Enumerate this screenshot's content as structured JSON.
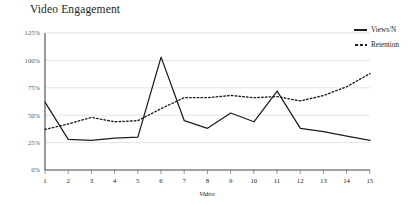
{
  "title": "Video Engagement",
  "legend": {
    "position": "top-right",
    "entries": [
      {
        "label": "Views/N",
        "style": "solid",
        "icon": "solid-line-icon"
      },
      {
        "label": "Retention",
        "style": "dotted",
        "icon": "dotted-line-icon"
      }
    ]
  },
  "axes": {
    "x_title": "Video",
    "y_ticks": [
      "0%",
      "25%",
      "50%",
      "75%",
      "100%",
      "125%"
    ],
    "x_ticks": [
      "1",
      "2",
      "3",
      "4",
      "5",
      "6",
      "7",
      "8",
      "9",
      "10",
      "11",
      "12",
      "13",
      "14",
      "15"
    ]
  },
  "colors": {
    "series": "#1d1d1d",
    "grid": "#d8d8d8",
    "axis": "#444444",
    "text": "#1d1d1d",
    "tick_text": "#5a5a5a",
    "background": "#ffffff"
  },
  "chart_data": {
    "type": "line",
    "title": "Video Engagement",
    "xlabel": "Video",
    "ylabel": "",
    "x": [
      1,
      2,
      3,
      4,
      5,
      6,
      7,
      8,
      9,
      10,
      11,
      12,
      13,
      14,
      15
    ],
    "categories": [
      "1",
      "2",
      "3",
      "4",
      "5",
      "6",
      "7",
      "8",
      "9",
      "10",
      "11",
      "12",
      "13",
      "14",
      "15"
    ],
    "series": [
      {
        "name": "Views/N",
        "style": "solid",
        "values": [
          62,
          28,
          27,
          29,
          30,
          103,
          45,
          38,
          52,
          44,
          72,
          38,
          35,
          31,
          27
        ]
      },
      {
        "name": "Retention",
        "style": "dotted",
        "values": [
          37,
          42,
          48,
          44,
          45,
          56,
          66,
          66,
          68,
          66,
          67,
          63,
          68,
          76,
          88
        ]
      }
    ],
    "ylim": [
      0,
      125
    ],
    "xlim": [
      1,
      15
    ],
    "ytick_values": [
      0,
      25,
      50,
      75,
      100,
      125
    ],
    "ytick_format": "percent",
    "grid": true,
    "legend_position": "top-right"
  }
}
